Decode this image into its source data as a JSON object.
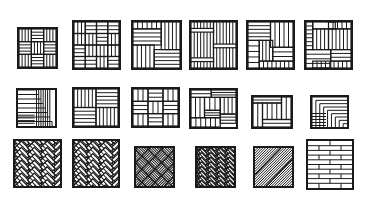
{
  "title": "Parquet floor patterns",
  "stroke_color": "#1a1a1a",
  "background_color": "#ffffff",
  "rows": [
    {
      "name": "row-1",
      "tiles": [
        {
          "id": "basket-weave-small",
          "label": "Basket weave (small)",
          "x": 17,
          "y": 27,
          "w": 41,
          "h": 42
        },
        {
          "id": "interlaced-weave",
          "label": "Interlaced weave",
          "x": 72,
          "y": 20,
          "w": 49,
          "h": 50
        },
        {
          "id": "four-block-square",
          "label": "Four block square",
          "x": 131,
          "y": 20,
          "w": 51,
          "h": 50
        },
        {
          "id": "vertical-plank-bands",
          "label": "Vertical plank with bands",
          "x": 189,
          "y": 20,
          "w": 49,
          "h": 50
        },
        {
          "id": "woven-windmill",
          "label": "Woven windmill",
          "x": 246,
          "y": 20,
          "w": 49,
          "h": 50
        },
        {
          "id": "pinwheel-stagger",
          "label": "Pinwheel stagger",
          "x": 304,
          "y": 20,
          "w": 49,
          "h": 50
        }
      ]
    },
    {
      "name": "row-2",
      "tiles": [
        {
          "id": "staggered-ladder",
          "label": "Staggered ladder",
          "x": 16,
          "y": 88,
          "w": 41,
          "h": 40
        },
        {
          "id": "four-square-checker",
          "label": "Four square checker",
          "x": 72,
          "y": 87,
          "w": 48,
          "h": 41
        },
        {
          "id": "basket-weave-large",
          "label": "Basket weave (large)",
          "x": 131,
          "y": 87,
          "w": 49,
          "h": 41
        },
        {
          "id": "woven-pinwheel",
          "label": "Woven pinwheel",
          "x": 189,
          "y": 88,
          "w": 49,
          "h": 41
        },
        {
          "id": "framed-plank",
          "label": "Framed plank",
          "x": 251,
          "y": 95,
          "w": 42,
          "h": 34
        },
        {
          "id": "stepped-diagonal",
          "label": "Stepped diagonal",
          "x": 310,
          "y": 95,
          "w": 39,
          "h": 34
        }
      ]
    },
    {
      "name": "row-3",
      "tiles": [
        {
          "id": "herringbone-double",
          "label": "Double herringbone",
          "x": 13,
          "y": 139,
          "w": 49,
          "h": 49
        },
        {
          "id": "herringbone-double-alt",
          "label": "Double herringbone (alt)",
          "x": 72,
          "y": 139,
          "w": 48,
          "h": 49
        },
        {
          "id": "diagonal-basket",
          "label": "Diagonal basket weave",
          "x": 134,
          "y": 146,
          "w": 41,
          "h": 42
        },
        {
          "id": "herringbone-chevron",
          "label": "Herringbone chevron",
          "x": 195,
          "y": 146,
          "w": 41,
          "h": 42
        },
        {
          "id": "diagonal-strip",
          "label": "Diagonal strip",
          "x": 253,
          "y": 146,
          "w": 41,
          "h": 42
        },
        {
          "id": "brick-bond",
          "label": "Brick bond planks",
          "x": 306,
          "y": 139,
          "w": 48,
          "h": 51
        }
      ]
    }
  ]
}
